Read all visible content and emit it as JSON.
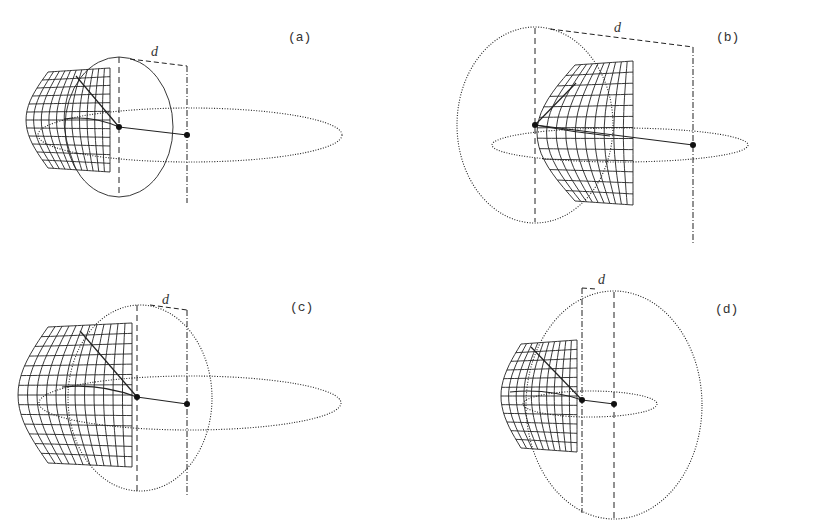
{
  "figure": {
    "panels": [
      {
        "id": "a",
        "label": "(a)",
        "label_pos": [
          288,
          30
        ],
        "distance_label": "d",
        "d_label_pos": [
          151,
          44
        ],
        "sphere": {
          "cx": 119,
          "cy": 127,
          "rx": 54,
          "ry": 70,
          "style": "solid"
        },
        "orbit": {
          "cx": 190,
          "cy": 135,
          "rx": 152,
          "ry": 27
        },
        "center_dot": [
          119,
          127
        ],
        "focus_dot": [
          187,
          135
        ],
        "axis_dashed": {
          "x": 119,
          "y1": 57,
          "y2": 195
        },
        "axis_dashdot": {
          "x": 187,
          "y1": 66,
          "y2": 203
        },
        "d_bracket": [
          [
            130,
            59
          ],
          [
            187,
            66
          ]
        ],
        "mesh": {
          "x0": 48,
          "y0": 70,
          "w": 62,
          "h": 100,
          "bulge": -22,
          "cols": 11,
          "rows": 12
        },
        "spoke_top": [
          76,
          76
        ],
        "spoke_mid": [
          64,
          119
        ]
      },
      {
        "id": "b",
        "label": "(b)",
        "label_pos": [
          716,
          30
        ],
        "distance_label": "d",
        "d_label_pos": [
          614,
          20
        ],
        "sphere": {
          "cx": 535,
          "cy": 125,
          "rx": 78,
          "ry": 98,
          "style": "dotted"
        },
        "orbit": {
          "cx": 620,
          "cy": 145,
          "rx": 128,
          "ry": 17
        },
        "center_dot": [
          535,
          125
        ],
        "focus_dot": [
          693,
          145
        ],
        "axis_dashed": {
          "x": 535,
          "y1": 28,
          "y2": 222
        },
        "axis_dashdot": {
          "x": 693,
          "y1": 47,
          "y2": 243
        },
        "d_bracket": [
          [
            550,
            29
          ],
          [
            693,
            47
          ]
        ],
        "mesh": {
          "x0": 575,
          "y0": 63,
          "w": 58,
          "h": 140,
          "bulge": -38,
          "cols": 10,
          "rows": 13
        },
        "spoke_top": [
          576,
          83
        ],
        "spoke_mid": [
          610,
          136
        ]
      },
      {
        "id": "c",
        "label": "(c)",
        "label_pos": [
          290,
          300
        ],
        "distance_label": "d",
        "d_label_pos": [
          162,
          292
        ],
        "sphere": {
          "cx": 140,
          "cy": 398,
          "rx": 72,
          "ry": 93,
          "style": "dotted"
        },
        "orbit": {
          "cx": 190,
          "cy": 403,
          "rx": 151,
          "ry": 27
        },
        "center_dot": [
          137,
          397
        ],
        "focus_dot": [
          187,
          404
        ],
        "axis_dashed": {
          "x": 137,
          "y1": 305,
          "y2": 492
        },
        "axis_dashdot": {
          "x": 187,
          "y1": 310,
          "y2": 497
        },
        "d_bracket": [
          [
            150,
            305
          ],
          [
            187,
            310
          ]
        ],
        "mesh": {
          "x0": 48,
          "y0": 325,
          "w": 84,
          "h": 140,
          "bulge": -30,
          "cols": 12,
          "rows": 14
        },
        "spoke_top": [
          80,
          331
        ],
        "spoke_mid": [
          62,
          387
        ]
      },
      {
        "id": "d",
        "label": "(d)",
        "label_pos": [
          715,
          302
        ],
        "distance_label": "d",
        "d_label_pos": [
          598,
          272
        ],
        "sphere": {
          "cx": 614,
          "cy": 405,
          "rx": 88,
          "ry": 114,
          "style": "dotted"
        },
        "orbit": {
          "cx": 590,
          "cy": 404,
          "rx": 67,
          "ry": 13
        },
        "center_dot": [
          582,
          400
        ],
        "focus_dot": [
          614,
          404
        ],
        "axis_dashed": {
          "x": 614,
          "y1": 292,
          "y2": 518
        },
        "axis_dashdot": {
          "x": 582,
          "y1": 288,
          "y2": 513
        },
        "d_bracket": [
          [
            582,
            288
          ],
          [
            596,
            289
          ]
        ],
        "mesh": {
          "x0": 521,
          "y0": 342,
          "w": 56,
          "h": 108,
          "bulge": -20,
          "cols": 10,
          "rows": 12
        },
        "spoke_top": [
          531,
          347
        ],
        "spoke_mid": [
          510,
          392
        ]
      }
    ],
    "colors": {
      "stroke": "#222222",
      "background": "#ffffff"
    }
  }
}
